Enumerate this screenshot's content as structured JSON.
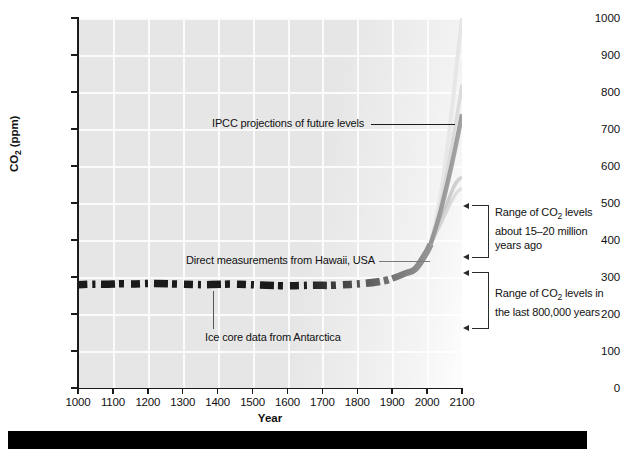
{
  "figure": {
    "background_color": "#ffffff",
    "plot_background_color": "#e6e6e6",
    "gridline_color": "#fbfbfb",
    "axis_color": "#1b1b1b",
    "bottom_bar_color": "#000000"
  },
  "chart_data": {
    "type": "line",
    "title": "",
    "xlabel": "Year",
    "ylabel": "CO2 (ppm)",
    "ylabel_display": "CO",
    "ylabel_sub": "2",
    "ylabel_unit": " (ppm)",
    "xlim": [
      1000,
      2100
    ],
    "ylim": [
      0,
      1000
    ],
    "grid": true,
    "legend": "none",
    "xticks": [
      1000,
      1100,
      1200,
      1300,
      1400,
      1500,
      1600,
      1700,
      1800,
      1900,
      2000,
      2100
    ],
    "yticks": [
      0,
      100,
      200,
      300,
      400,
      500,
      600,
      700,
      800,
      900,
      1000
    ],
    "series": [
      {
        "name": "Ice core data from Antarctica",
        "style": "dashed-thick-black",
        "x": [
          1000,
          1040,
          1080,
          1120,
          1160,
          1200,
          1240,
          1280,
          1320,
          1360,
          1400,
          1440,
          1480,
          1520,
          1560,
          1600,
          1640,
          1680,
          1720,
          1760,
          1800,
          1840,
          1880,
          1900
        ],
        "values": [
          279,
          281,
          280,
          282,
          281,
          283,
          282,
          281,
          280,
          279,
          280,
          281,
          280,
          278,
          277,
          276,
          277,
          278,
          277,
          279,
          281,
          284,
          290,
          296
        ]
      },
      {
        "name": "Direct measurements from Hawaii, USA",
        "style": "solid-thick-black",
        "x": [
          1900,
          1920,
          1940,
          1958,
          1970,
          1980,
          1990,
          2000,
          2010
        ],
        "values": [
          296,
          303,
          311,
          315,
          325,
          338,
          354,
          369,
          389
        ]
      },
      {
        "name": "IPCC projection - highest scenario",
        "style": "solid-light-gray",
        "x": [
          2010,
          2030,
          2050,
          2070,
          2090,
          2100
        ],
        "values": [
          389,
          470,
          590,
          740,
          920,
          1000
        ]
      },
      {
        "name": "IPCC projection - high scenario",
        "style": "solid-mid-gray",
        "x": [
          2010,
          2030,
          2050,
          2070,
          2090,
          2100
        ],
        "values": [
          389,
          455,
          545,
          650,
          760,
          820
        ]
      },
      {
        "name": "IPCC projection - central scenario",
        "style": "solid-black",
        "x": [
          2010,
          2030,
          2050,
          2070,
          2090,
          2100
        ],
        "values": [
          389,
          445,
          520,
          600,
          690,
          740
        ]
      },
      {
        "name": "IPCC projection - low scenario",
        "style": "solid-gray",
        "x": [
          2010,
          2030,
          2050,
          2070,
          2085,
          2100
        ],
        "values": [
          389,
          430,
          480,
          530,
          560,
          570
        ]
      },
      {
        "name": "IPCC projection - lowest scenario",
        "style": "solid-gray-thin",
        "x": [
          2010,
          2030,
          2050,
          2070,
          2085,
          2100
        ],
        "values": [
          389,
          425,
          465,
          505,
          530,
          540
        ]
      }
    ],
    "annotations": [
      {
        "id": "ipcc",
        "text": "IPCC projections of future levels",
        "x_px": 212,
        "y_px": 124,
        "leader_from_px": 371,
        "leader_to_px": 455,
        "leader_y_px": 124
      },
      {
        "id": "hawaii",
        "text": "Direct measurements from Hawaii, USA",
        "x_px": 186,
        "y_px": 261,
        "leader_from_px": 379,
        "leader_to_px": 430,
        "leader_y_px": 261
      },
      {
        "id": "icecore",
        "text": "Ice core data from Antarctica",
        "x_px": 205,
        "y_px": 338,
        "leader_x_px": 213,
        "leader_top_px": 291,
        "leader_bottom_px": 329
      }
    ]
  },
  "callouts": [
    {
      "id": "range-15-20-million",
      "lines": [
        "Range of CO",
        "2",
        " levels",
        "about 15–20 million",
        "years ago"
      ],
      "line1_pre": "Range of CO",
      "line1_sub": "2",
      "line1_post": " levels",
      "line2": "about 15–20 million",
      "line3": "years ago",
      "bracket_top_px": 205,
      "bracket_bottom_px": 256,
      "approx_ppm_range": [
        400,
        550
      ]
    },
    {
      "id": "range-last-800000-years",
      "lines": [
        "Range of CO",
        "2",
        " levels in",
        "the last 800,000 years"
      ],
      "line1_pre": "Range of CO",
      "line1_sub": "2",
      "line1_post": " levels in",
      "line2": "the last 800,000 years",
      "line3": "",
      "bracket_top_px": 272,
      "bracket_bottom_px": 327,
      "approx_ppm_range": [
        170,
        300
      ]
    }
  ],
  "axis": {
    "x_title": "Year",
    "y_title_pre": "CO",
    "y_title_sub": "2",
    "y_title_post": " (ppm)"
  }
}
